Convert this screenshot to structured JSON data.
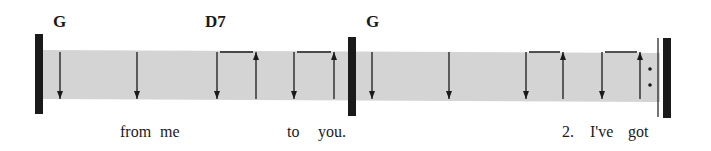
{
  "strum_chart": {
    "measures": [
      {
        "chords": [
          {
            "symbol": "G",
            "beat": 1
          },
          {
            "symbol": "D7",
            "beat": 3
          }
        ],
        "strums": [
          "down",
          "down",
          "down",
          "up",
          "down",
          "up"
        ],
        "beams": [
          [
            2,
            3
          ],
          [
            4,
            5
          ]
        ]
      },
      {
        "chords": [
          {
            "symbol": "G",
            "beat": 1
          }
        ],
        "strums": [
          "down",
          "down",
          "down",
          "up",
          "down",
          "up"
        ],
        "beams": [
          [
            2,
            3
          ],
          [
            4,
            5
          ]
        ],
        "repeat_end": true
      }
    ],
    "chord_labels": [
      "G",
      "D7",
      "G"
    ],
    "lyrics": [
      "from",
      "me",
      "to",
      "you.",
      "2.",
      "I've",
      "got"
    ],
    "colors": {
      "band": "#d4d4d4",
      "ink": "#1a1a1a"
    }
  }
}
